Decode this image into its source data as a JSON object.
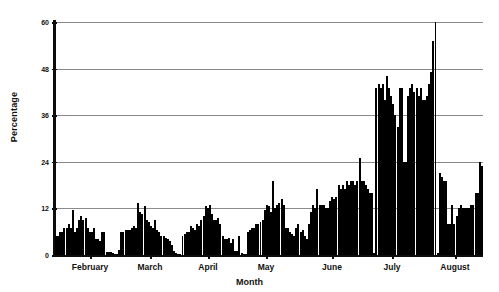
{
  "chart_data": {
    "type": "bar",
    "title": "",
    "subtitle": "",
    "xlabel": "Month",
    "ylabel": "Percentage",
    "ylim": [
      0,
      60
    ],
    "yticks": [
      0,
      12,
      24,
      36,
      48,
      60
    ],
    "ytick_labels": [
      "0",
      "12",
      "24",
      "36",
      "48",
      "60"
    ],
    "grid": true,
    "legend": null,
    "xtick_labels": [
      "February",
      "March",
      "April",
      "May",
      "June",
      "July",
      "August"
    ],
    "xtick_positions_px": [
      90,
      150,
      208,
      266,
      332,
      392,
      455
    ],
    "categories": [
      "Feb-01",
      "Feb-02",
      "Feb-03",
      "Feb-04",
      "Feb-05",
      "Feb-06",
      "Feb-07",
      "Feb-08",
      "Feb-09",
      "Feb-10",
      "Feb-11",
      "Feb-12",
      "Feb-13",
      "Feb-14",
      "Feb-15",
      "Feb-16",
      "Feb-17",
      "Feb-18",
      "Feb-19",
      "Feb-20",
      "Feb-21",
      "Feb-22",
      "Feb-23",
      "Feb-24",
      "Feb-25",
      "Feb-26",
      "Feb-27",
      "Feb-28",
      "Mar-01",
      "Mar-02",
      "Mar-03",
      "Mar-04",
      "Mar-05",
      "Mar-06",
      "Mar-07",
      "Mar-08",
      "Mar-09",
      "Mar-10",
      "Mar-11",
      "Mar-12",
      "Mar-13",
      "Mar-14",
      "Mar-15",
      "Mar-16",
      "Mar-17",
      "Mar-18",
      "Mar-19",
      "Mar-20",
      "Mar-21",
      "Mar-22",
      "Mar-23",
      "Mar-24",
      "Mar-25",
      "Mar-26",
      "Mar-27",
      "Mar-28",
      "Mar-29",
      "Mar-30",
      "Mar-31",
      "Apr-01",
      "Apr-02",
      "Apr-03",
      "Apr-04",
      "Apr-05",
      "Apr-06",
      "Apr-07",
      "Apr-08",
      "Apr-09",
      "Apr-10",
      "Apr-11",
      "Apr-12",
      "Apr-13",
      "Apr-14",
      "Apr-15",
      "Apr-16",
      "Apr-17",
      "Apr-18",
      "Apr-19",
      "Apr-20",
      "Apr-21",
      "Apr-22",
      "Apr-23",
      "Apr-24",
      "Apr-25",
      "Apr-26",
      "Apr-27",
      "Apr-28",
      "Apr-29",
      "Apr-30",
      "May-01",
      "May-02",
      "May-03",
      "May-04",
      "May-05",
      "May-06",
      "May-07",
      "May-08",
      "May-09",
      "May-10",
      "May-11",
      "May-12",
      "May-13",
      "May-14",
      "May-15",
      "May-16",
      "May-17",
      "May-18",
      "May-19",
      "May-20",
      "May-21",
      "May-22",
      "May-23",
      "May-24",
      "May-25",
      "May-26",
      "May-27",
      "May-28",
      "May-29",
      "May-30",
      "May-31",
      "Jun-01",
      "Jun-02",
      "Jun-03",
      "Jun-04",
      "Jun-05",
      "Jun-06",
      "Jun-07",
      "Jun-08",
      "Jun-09",
      "Jun-10",
      "Jun-11",
      "Jun-12",
      "Jun-13",
      "Jun-14",
      "Jun-15",
      "Jun-16",
      "Jun-17",
      "Jun-18",
      "Jun-19",
      "Jun-20",
      "Jun-21",
      "Jun-22",
      "Jun-23",
      "Jun-24",
      "Jun-25",
      "Jun-26",
      "Jun-27",
      "Jun-28",
      "Jun-29",
      "Jun-30",
      "Jul-01",
      "Jul-02",
      "Jul-03",
      "Jul-04",
      "Jul-05",
      "Jul-06",
      "Jul-07",
      "Jul-08",
      "Jul-09",
      "Jul-10",
      "Jul-11",
      "Jul-12",
      "Jul-13",
      "Jul-14",
      "Jul-15",
      "Jul-16",
      "Jul-17",
      "Jul-18",
      "Jul-19",
      "Jul-20",
      "Jul-21",
      "Jul-22",
      "Jul-23",
      "Jul-24",
      "Jul-25",
      "Jul-26",
      "Jul-27",
      "Jul-28",
      "Jul-29",
      "Jul-30",
      "Jul-31",
      "Aug-01",
      "Aug-02",
      "Aug-03",
      "Aug-04",
      "Aug-05",
      "Aug-06",
      "Aug-07",
      "Aug-08",
      "Aug-09",
      "Aug-10",
      "Aug-11",
      "Aug-12",
      "Aug-13",
      "Aug-14",
      "Aug-15",
      "Aug-16",
      "Aug-17",
      "Aug-18",
      "Aug-19",
      "Aug-20",
      "Aug-21",
      "Aug-22"
    ],
    "values": [
      5,
      5,
      6,
      6,
      7,
      7,
      8,
      7,
      11.5,
      6,
      7,
      9,
      10,
      9,
      9.5,
      7,
      6,
      6,
      7,
      4,
      4,
      3.5,
      6,
      6,
      0.8,
      0.8,
      0.8,
      0.5,
      0.3,
      0.3,
      1.2,
      6,
      6,
      6.5,
      6.5,
      6.5,
      7,
      7.5,
      7,
      13.5,
      11,
      10.5,
      12.5,
      9,
      8.5,
      7.5,
      7,
      9,
      6.5,
      6,
      5,
      5,
      4.5,
      4,
      3.5,
      2.5,
      1,
      0.5,
      0.3,
      0.3,
      5,
      5.5,
      6,
      6,
      7.5,
      7,
      6.5,
      8,
      7.5,
      9,
      10,
      12.5,
      12,
      12.8,
      10.5,
      9,
      9,
      9.5,
      8,
      5,
      4,
      4,
      4.5,
      3,
      4,
      1,
      1,
      5,
      0.5,
      0.3,
      0.3,
      6,
      6.5,
      7,
      7,
      8,
      8,
      8.5,
      9,
      11.5,
      13,
      12.5,
      11,
      19,
      12,
      13,
      13.5,
      14.5,
      13,
      7,
      7,
      6,
      5.5,
      5,
      7,
      8,
      6,
      6.5,
      5,
      4,
      8,
      11,
      13,
      12,
      17,
      13,
      13,
      13,
      12,
      12,
      14,
      15,
      14.5,
      15,
      18,
      17,
      18,
      17,
      19,
      18,
      19,
      19,
      18,
      19,
      25,
      19,
      19,
      18,
      17,
      16,
      16,
      0.5,
      43,
      44,
      43,
      44,
      40,
      46,
      43,
      41,
      39,
      36,
      33,
      43,
      43,
      24,
      24,
      41,
      43,
      44,
      42,
      43,
      41,
      43,
      40,
      40,
      41,
      44,
      47,
      55,
      60,
      0.5,
      21,
      20,
      19,
      19,
      8,
      8,
      13,
      8,
      10,
      12,
      13,
      12,
      12,
      12,
      12,
      13,
      13,
      16,
      16,
      24,
      23
    ]
  }
}
